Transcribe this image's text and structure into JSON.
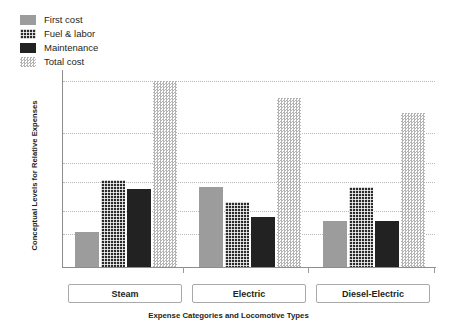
{
  "chart_data": {
    "type": "bar",
    "title": "",
    "xlabel": "Expense Categories and Locomotive Types",
    "ylabel": "Conceptual Levels for Relative Expenses",
    "categories": [
      "Steam",
      "Electric",
      "Diesel-Electric"
    ],
    "series": [
      {
        "name": "First cost",
        "values": [
          0.19,
          0.43,
          0.25
        ],
        "color": "#9c9c9c",
        "pattern": "solid-gray"
      },
      {
        "name": "Fuel & labor",
        "values": [
          0.47,
          0.35,
          0.43
        ],
        "color": "#2b2b2b",
        "pattern": "cross-hatch"
      },
      {
        "name": "Maintenance",
        "values": [
          0.42,
          0.27,
          0.25
        ],
        "color": "#222222",
        "pattern": "solid-dark"
      },
      {
        "name": "Total cost",
        "values": [
          1.0,
          0.91,
          0.83
        ],
        "color": "#b4b4b4",
        "pattern": "stipple-dots"
      }
    ],
    "ylim": [
      0,
      1.06
    ],
    "ytick_values": [
      0.18,
      0.3,
      0.46,
      0.56,
      0.72,
      1.0
    ],
    "ytick_labels": [],
    "grid": true,
    "grid_axis": "y",
    "legend_position": "top-left",
    "axis_numbers_shown": false
  },
  "legend": {
    "items": [
      {
        "label": "First cost"
      },
      {
        "label": "Fuel & labor"
      },
      {
        "label": "Maintenance"
      },
      {
        "label": "Total cost"
      }
    ]
  },
  "axes": {
    "y_title": "Conceptual Levels for Relative Expenses",
    "x_title": "Expense Categories and Locomotive Types"
  },
  "category_boxes": [
    {
      "label": "Steam"
    },
    {
      "label": "Electric"
    },
    {
      "label": "Diesel-Electric"
    }
  ]
}
